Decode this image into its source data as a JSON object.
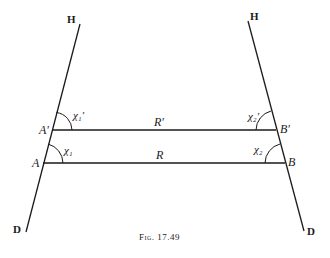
{
  "figure": {
    "caption": "Fig. 17.49",
    "stroke_color": "#1a1a1a",
    "left_line": {
      "top_label": "H",
      "bottom_label": "D"
    },
    "right_line": {
      "top_label": "H",
      "bottom_label": "D"
    },
    "points": {
      "A_prime": "A′",
      "A": "A",
      "B_prime": "B′",
      "B": "B"
    },
    "segments": {
      "upper": "R′",
      "lower": "R"
    },
    "angles": {
      "chi1_prime": "χ₁′",
      "chi1": "χ₁",
      "chi2_prime": "χ₂′",
      "chi2": "χ₂"
    }
  }
}
